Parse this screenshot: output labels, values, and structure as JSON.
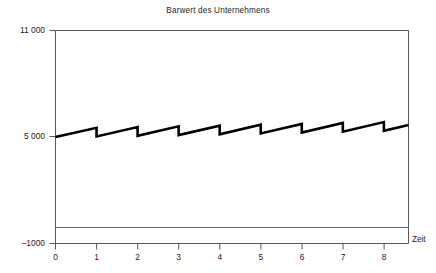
{
  "chart_data": {
    "type": "line",
    "title": "Barwert des Unternehmens",
    "xlabel": "Zeit",
    "ylabel": "",
    "xlim": [
      0,
      8.6
    ],
    "ylim": [
      -1000,
      11000
    ],
    "grid": false,
    "legend": null,
    "x_tick_labels": [
      "0",
      "1",
      "2",
      "3",
      "4",
      "5",
      "6",
      "7",
      "8"
    ],
    "x_ticks": [
      0,
      1,
      2,
      3,
      4,
      5,
      6,
      7,
      8
    ],
    "y_tick_labels": [
      "11 000",
      "5 000",
      "–1000"
    ],
    "y_ticks": [
      11000,
      5000,
      -1000
    ],
    "zero_reference_line": 0,
    "series": [
      {
        "name": "Barwert",
        "style": "sawtooth",
        "line_color": "#000000",
        "line_width": 2.6,
        "points": [
          [
            0.0,
            5000
          ],
          [
            1.0,
            5520
          ],
          [
            1.0,
            5030
          ],
          [
            2.0,
            5560
          ],
          [
            2.0,
            5070
          ],
          [
            3.0,
            5600
          ],
          [
            3.0,
            5110
          ],
          [
            4.0,
            5640
          ],
          [
            4.0,
            5150
          ],
          [
            5.0,
            5690
          ],
          [
            5.0,
            5200
          ],
          [
            6.0,
            5740
          ],
          [
            6.0,
            5250
          ],
          [
            7.0,
            5790
          ],
          [
            7.0,
            5300
          ],
          [
            8.0,
            5840
          ],
          [
            8.0,
            5350
          ],
          [
            8.6,
            5680
          ]
        ]
      }
    ]
  },
  "caption": {
    "text": ""
  }
}
